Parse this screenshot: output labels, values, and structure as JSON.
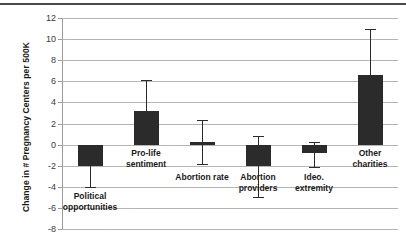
{
  "chart_data": {
    "type": "bar",
    "title": "",
    "subtitle": "",
    "xlabel": "",
    "ylabel": "Change in # Pregnancy Centers per 500K",
    "ylim": [
      -8,
      12
    ],
    "yticks": [
      12,
      10,
      8,
      6,
      4,
      2,
      0,
      -2,
      -4,
      -6,
      -8
    ],
    "ytick_labels": [
      "12",
      "10",
      "8",
      "6",
      "4",
      "2",
      "0",
      "-2",
      "-4",
      "-6",
      "-8"
    ],
    "grid": "horizontal",
    "legend": "none",
    "bar_color": "#2b2b2b",
    "error_bars": "asymmetric confidence intervals",
    "categories": [
      "Political opportunities",
      "Pro-life sentiment",
      "Abortion rate",
      "Abortion providers",
      "Ideo. extremity",
      "Other charities"
    ],
    "values": [
      -2.0,
      3.2,
      0.25,
      -2.0,
      -0.8,
      6.6
    ],
    "error_low": [
      -4.0,
      0.6,
      -1.8,
      -5.0,
      -2.1,
      2.2
    ],
    "error_high": [
      0.0,
      6.1,
      2.3,
      0.8,
      0.2,
      11.0
    ],
    "points": [
      {
        "category": "Political opportunities",
        "label_lines": [
          "Political",
          "opportunities"
        ],
        "value": -2.0,
        "ci_low": -4.0,
        "ci_high": 0.0,
        "label_y_value": -4.4
      },
      {
        "category": "Pro-life sentiment",
        "label_lines": [
          "Pro-life",
          "sentiment"
        ],
        "value": 3.2,
        "ci_low": 0.6,
        "ci_high": 6.1,
        "label_y_value": -0.3
      },
      {
        "category": "Abortion rate",
        "label_lines": [
          "Abortion rate"
        ],
        "value": 0.25,
        "ci_low": -1.8,
        "ci_high": 2.3,
        "label_y_value": -2.6
      },
      {
        "category": "Abortion providers",
        "label_lines": [
          "Abortion",
          "providers"
        ],
        "value": -2.0,
        "ci_low": -5.0,
        "ci_high": 0.8,
        "label_y_value": -2.6
      },
      {
        "category": "Ideo. extremity",
        "label_lines": [
          "Ideo.",
          "extremity"
        ],
        "value": -0.8,
        "ci_low": -2.1,
        "ci_high": 0.2,
        "label_y_value": -2.6
      },
      {
        "category": "Other charities",
        "label_lines": [
          "Other",
          "charities"
        ],
        "value": 6.6,
        "ci_low": 2.2,
        "ci_high": 11.0,
        "label_y_value": -0.3
      }
    ]
  }
}
